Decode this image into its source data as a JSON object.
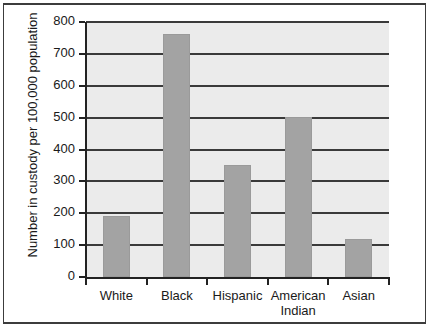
{
  "chart_data": {
    "type": "bar",
    "title": "",
    "subtitle": "",
    "xlabel": "",
    "ylabel": "Number in custody per 100,000 population",
    "categories": [
      "White",
      "Black",
      "Hispanic",
      "American\nIndian",
      "Asian"
    ],
    "values": [
      190,
      762,
      352,
      502,
      120
    ],
    "ylim": [
      0,
      800
    ],
    "yticks": [
      0,
      100,
      200,
      300,
      400,
      500,
      600,
      700,
      800
    ],
    "ytick_labels": [
      "0",
      "100",
      "200",
      "300",
      "400",
      "500",
      "600",
      "700",
      "800"
    ],
    "grid": true,
    "grid_axis": "y",
    "legend": false,
    "legend_position": "none",
    "bar_color": "#a3a3a3",
    "plot_background": "#ebebeb",
    "axis_color": "#222222",
    "gridline_color": "#3a3a3a",
    "frame_color": "#3c3c3c"
  }
}
